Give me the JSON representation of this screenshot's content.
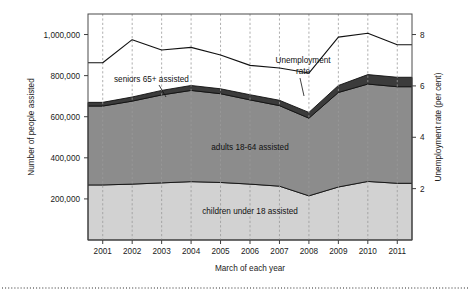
{
  "chart_data": {
    "type": "area",
    "title": "",
    "subtitle": "",
    "xlabel": "March of each year",
    "ylabel": "Number of people assisted",
    "y2label": "Unemployment rate (per cent)",
    "categories": [
      "2001",
      "2002",
      "2003",
      "2004",
      "2005",
      "2006",
      "2007",
      "2008",
      "2009",
      "2010",
      "2011"
    ],
    "x": [
      2001,
      2002,
      2003,
      2004,
      2005,
      2006,
      2007,
      2008,
      2009,
      2010,
      2011
    ],
    "ylim": [
      0,
      1100000
    ],
    "y2lim": [
      0,
      8.8
    ],
    "yticks": [
      200000,
      400000,
      600000,
      800000,
      1000000
    ],
    "ytick_labels": [
      "200,000",
      "400,000",
      "600,000",
      "800,000",
      "1,000,000"
    ],
    "y2ticks": [
      2,
      4,
      6,
      8
    ],
    "y2tick_labels": [
      "2",
      "4",
      "6",
      "8"
    ],
    "grid": "vertical-dashed",
    "legend": "inline-annotations",
    "stacked": true,
    "series": [
      {
        "name": "children under 18 assisted",
        "kind": "area",
        "color": "#d2d2d2",
        "values": [
          268000,
          272000,
          278000,
          284000,
          280000,
          272000,
          262000,
          215000,
          258000,
          285000,
          276000
        ]
      },
      {
        "name": "adults 18-64 assisted",
        "kind": "area",
        "color": "#8c8c8c",
        "values": [
          384000,
          404000,
          428000,
          444000,
          432000,
          410000,
          392000,
          378000,
          460000,
          474000,
          470000
        ]
      },
      {
        "name": "seniors 65+ assisted",
        "kind": "area",
        "color": "#3b3b3b",
        "values": [
          18000,
          20000,
          22000,
          24000,
          24000,
          25000,
          26000,
          28000,
          34000,
          46000,
          46000
        ]
      },
      {
        "name": "Unemployment rate",
        "kind": "line",
        "axis": "right",
        "color": "#111111",
        "values": [
          6.9,
          7.8,
          7.4,
          7.5,
          7.2,
          6.8,
          6.7,
          6.5,
          7.9,
          8.05,
          7.6
        ]
      }
    ],
    "stack_totals": [
      670000,
      696000,
      728000,
      752000,
      736000,
      707000,
      680000,
      621000,
      752000,
      805000,
      792000
    ],
    "annotations": [
      {
        "name": "seniors-65-label",
        "text": "seniors 65+ assisted"
      },
      {
        "name": "unemployment-rate-label-line1",
        "text": "Unemployment"
      },
      {
        "name": "unemployment-rate-label-line2",
        "text": "rate"
      },
      {
        "name": "adults-band-label",
        "text": "adults 18-64 assisted"
      },
      {
        "name": "children-band-label",
        "text": "children under 18 assisted"
      }
    ]
  },
  "axes": {
    "left_title": "Number of people assisted",
    "right_title": "Unemployment rate (per cent)",
    "bottom_title": "March of each year"
  },
  "colors": {
    "children": "#d2d2d2",
    "adults": "#8c8c8c",
    "seniors": "#3b3b3b",
    "line": "#111111",
    "frame": "#4a4a4a",
    "grid": "#9b9b9b",
    "background": "#ffffff"
  }
}
